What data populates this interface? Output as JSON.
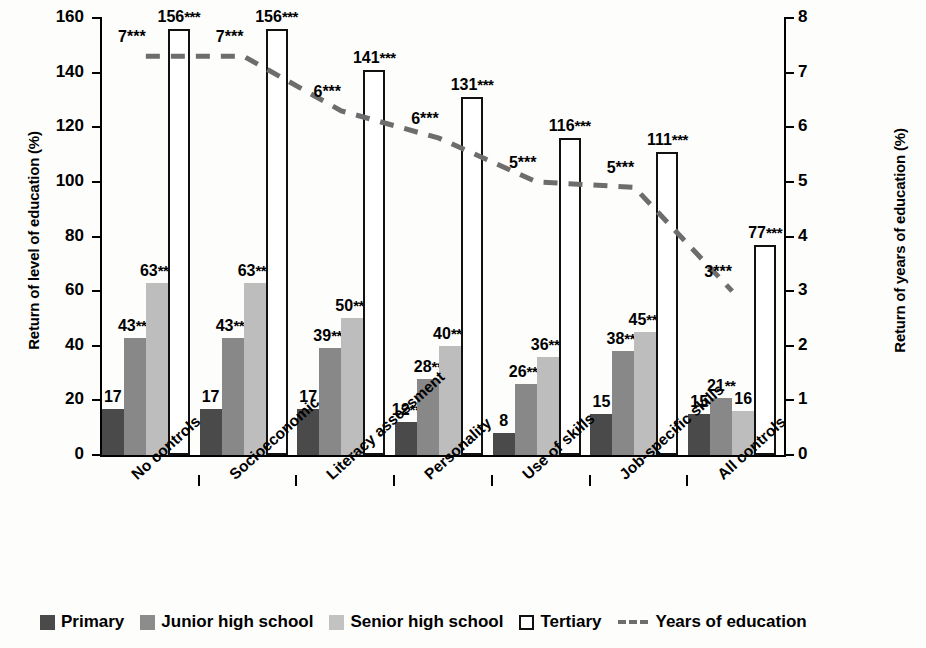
{
  "chart_data": {
    "type": "bar",
    "title": "",
    "categories": [
      "No controls",
      "Socioeconomic",
      "Literacy assessment",
      "Personality",
      "Use of skills",
      "Job-specific skills",
      "All controls"
    ],
    "ylabel": "Return of level of education (%)",
    "y2label": "Return of years of education (%)",
    "xlabel": "",
    "ylim": [
      0,
      160
    ],
    "y2lim": [
      0,
      8
    ],
    "yticks": [
      0,
      20,
      40,
      60,
      80,
      100,
      120,
      140,
      160
    ],
    "y2ticks": [
      0,
      1,
      2,
      3,
      4,
      5,
      6,
      7,
      8
    ],
    "grid": false,
    "legend_position": "bottom",
    "series": [
      {
        "name": "Primary",
        "color": "#4a4a4a",
        "values": [
          17,
          17,
          17,
          12,
          8,
          15,
          15
        ],
        "labels": [
          "17",
          "17",
          "17",
          "12",
          "8",
          "15",
          "15"
        ],
        "significance": [
          "",
          "",
          "",
          "**",
          "",
          "",
          ""
        ]
      },
      {
        "name": "Junior high school",
        "color": "#888888",
        "values": [
          43,
          43,
          39,
          28,
          26,
          38,
          21
        ],
        "labels": [
          "43",
          "43",
          "39",
          "28",
          "26",
          "38",
          "21"
        ],
        "significance": [
          "***",
          "***",
          "***",
          "**",
          "***",
          "***",
          "**"
        ]
      },
      {
        "name": "Senior high school",
        "color": "#bdbdbd",
        "values": [
          63,
          63,
          50,
          40,
          36,
          45,
          16
        ],
        "labels": [
          "63",
          "63",
          "50",
          "40",
          "36",
          "45",
          "16"
        ],
        "significance": [
          "***",
          "***",
          "***",
          "***",
          "***",
          "***",
          ""
        ]
      },
      {
        "name": "Tertiary",
        "color": "#ffffff",
        "values": [
          156,
          156,
          141,
          131,
          116,
          111,
          77
        ],
        "labels": [
          "156",
          "156",
          "141",
          "131",
          "116",
          "111",
          "77"
        ],
        "significance": [
          "***",
          "***",
          "***",
          "***",
          "***",
          "***",
          "***"
        ]
      }
    ],
    "line_series": {
      "name": "Years of education",
      "color": "#6d6d6d",
      "axis": "right",
      "values": [
        7.3,
        7.3,
        6.3,
        5.8,
        5.0,
        4.9,
        3.0
      ],
      "labels": [
        "7",
        "7",
        "6",
        "6",
        "5",
        "5",
        "3"
      ],
      "significance": [
        "***",
        "***",
        "***",
        "***",
        "***",
        "***",
        "***"
      ]
    }
  },
  "legend": {
    "items": [
      {
        "label": "Primary",
        "marker": "primary"
      },
      {
        "label": "Junior high school",
        "marker": "junior"
      },
      {
        "label": "Senior high school",
        "marker": "senior"
      },
      {
        "label": "Tertiary",
        "marker": "tertiary"
      },
      {
        "label": "Years of education",
        "marker": "dash"
      }
    ]
  }
}
